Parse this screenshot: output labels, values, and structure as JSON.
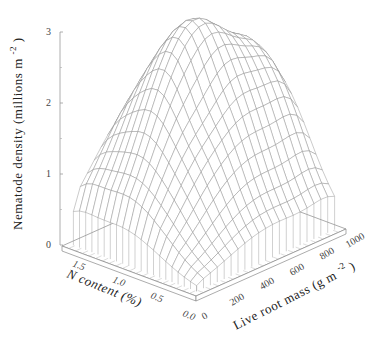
{
  "chart_data": {
    "type": "surface3d",
    "title": "",
    "zlabel": "Nematode density  (millions m^-2)",
    "zlabel_main": "Nematode density  (millions m",
    "zlabel_sup": "-2",
    "zlabel_close": ")",
    "xlabel": "N content (%)",
    "ylabel_main": "Live root mass (g m",
    "ylabel_sup": "-2",
    "ylabel_close": ")",
    "z_ticks": [
      "0",
      "1",
      "2",
      "3"
    ],
    "z_range": [
      0,
      3
    ],
    "x_ticks": [
      "1.5",
      "1.0",
      "0.5",
      "0.0"
    ],
    "x_range": [
      0.0,
      1.7
    ],
    "y_ticks": [
      "0",
      "200",
      "400",
      "600",
      "800",
      "1000"
    ],
    "y_range": [
      0,
      1000
    ],
    "grid_resolution": [
      20,
      20
    ],
    "surface_description": "Smoothed surface: near zero along low root mass (0) and high N edges, rising to a broad peak ~2.9-3.0 million m^-2 at intermediate N content (~0.8-1.3%) and root mass ~400-700 g m^-2; about 1.2 at N 1.5% edge, ~1.2 at root mass 1000 edge",
    "peak": {
      "n_content": 1.0,
      "root_mass": 550,
      "density": 3.0
    },
    "sample_points": [
      {
        "n_content": 1.5,
        "root_mass": 1000,
        "density": 1.3
      },
      {
        "n_content": 1.5,
        "root_mass": 500,
        "density": 2.4
      },
      {
        "n_content": 1.0,
        "root_mass": 500,
        "density": 3.0
      },
      {
        "n_content": 0.5,
        "root_mass": 500,
        "density": 2.1
      },
      {
        "n_content": 0.0,
        "root_mass": 1000,
        "density": 1.2
      },
      {
        "n_content": 0.0,
        "root_mass": 200,
        "density": 0.3
      }
    ]
  }
}
